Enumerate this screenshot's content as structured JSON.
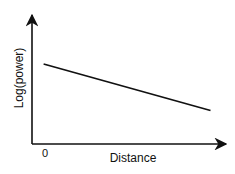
{
  "chart_data": {
    "type": "line",
    "title": "",
    "xlabel": "Distance",
    "ylabel": "Log(power)",
    "x_tick_labels": [
      "0"
    ],
    "grid": false,
    "legend": null,
    "xlim": [
      0,
      10
    ],
    "ylim": [
      0,
      10
    ],
    "series": [
      {
        "name": "log-power-vs-distance",
        "x": [
          0.6,
          9.2
        ],
        "y": [
          6.2,
          2.6
        ]
      }
    ]
  },
  "colors": {
    "axis": "#111111",
    "line": "#111111",
    "background": "#ffffff"
  }
}
